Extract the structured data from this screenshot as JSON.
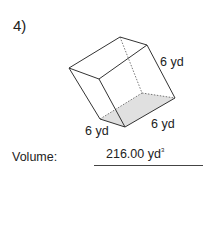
{
  "problem": {
    "number": "4)",
    "shape": "cube",
    "labels": {
      "right_edge": "6 yd",
      "front_bottom_left": "6 yd",
      "front_bottom_right": "6 yd"
    },
    "volume_label": "Volume:",
    "volume_value": "216.00 yd",
    "volume_unit_exponent": "3"
  }
}
